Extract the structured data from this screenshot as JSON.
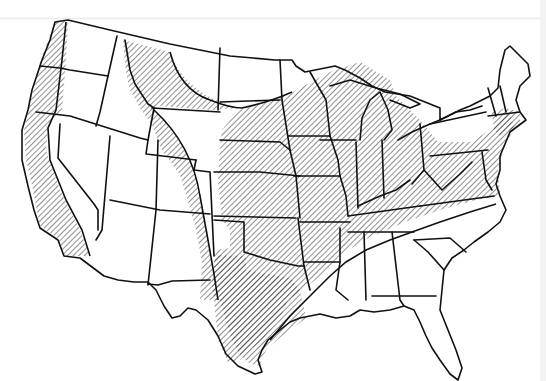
{
  "map": {
    "subject": "contiguous-united-states-state-outline",
    "style": "black-and-white line map",
    "colors": {
      "background": "#ffffff",
      "outline": "#111111",
      "hatch": "#111111"
    },
    "legend": null,
    "labels": [],
    "hatched_regions": [
      {
        "id": "pacific-coast",
        "description": "Western Washington, western Oregon, coastal and central California strip"
      },
      {
        "id": "northern-rockies-plains",
        "description": "Northern Idaho panhandle, western and central Montana arc, Wyoming east, eastern Colorado, western Texas panhandle"
      },
      {
        "id": "central-eastern-interior",
        "description": "Southern North Dakota and below through Plains, Midwest, Great Lakes states, Ohio Valley, Mid-Atlantic, southern New England, Texas, Oklahoma, Arkansas, Missouri, Tennessee, Kentucky, Virginia, West Virginia, northern Mississippi/Alabama"
      }
    ],
    "unhatched_regions": [
      "Nevada",
      "Utah",
      "Arizona",
      "New Mexico",
      "western Colorado",
      "southern Idaho",
      "eastern Oregon",
      "eastern Washington",
      "northern Montana plains",
      "North Dakota north",
      "Louisiana",
      "southern Mississippi",
      "southern Alabama",
      "Georgia",
      "Florida",
      "South Carolina",
      "North Carolina",
      "New York",
      "Vermont",
      "New Hampshire",
      "Maine"
    ]
  }
}
